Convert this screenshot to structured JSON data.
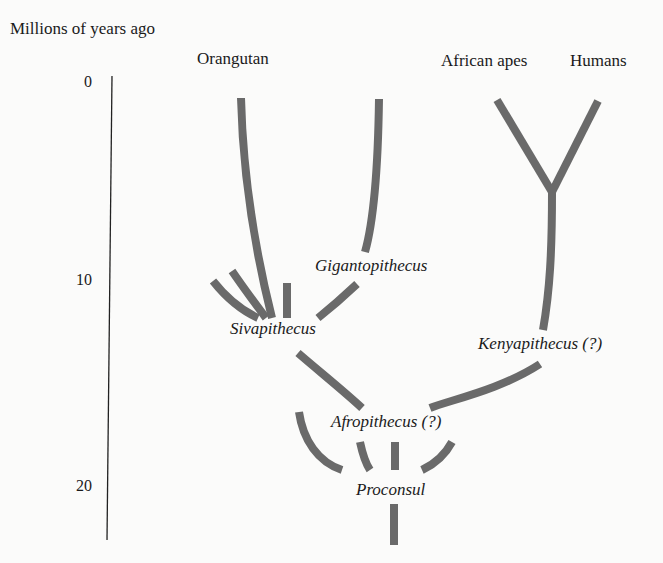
{
  "axis": {
    "title": "Millions of years ago",
    "ticks": [
      {
        "label": "0",
        "value": 0
      },
      {
        "label": "10",
        "value": 10
      },
      {
        "label": "20",
        "value": 20
      }
    ]
  },
  "living_taxa": {
    "orangutan": "Orangutan",
    "african_apes": "African apes",
    "humans": "Humans"
  },
  "fossil_taxa": {
    "gigantopithecus": "Gigantopithecus",
    "sivapithecus": "Sivapithecus",
    "kenyapithecus": "Kenyapithecus (?)",
    "afropithecus": "Afropithecus (?)",
    "proconsul": "Proconsul"
  },
  "colors": {
    "branch": "#6a6a6a",
    "axis": "#222222",
    "background": "#fbfbfa"
  }
}
